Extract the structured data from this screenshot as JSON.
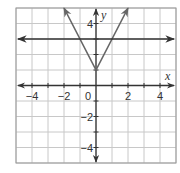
{
  "chart_data": {
    "type": "line",
    "title": "",
    "xlabel": "x",
    "ylabel": "y",
    "xlim": [
      -5,
      5
    ],
    "ylim": [
      -5,
      5
    ],
    "grid": true,
    "x_ticks": [
      -4,
      -2,
      0,
      2,
      4
    ],
    "y_ticks": [
      -4,
      -2,
      4
    ],
    "x_tick_labels": [
      "−4",
      "−2",
      "0",
      "2",
      "4"
    ],
    "y_tick_labels": [
      "−4",
      "−2",
      "4"
    ],
    "series": [
      {
        "name": "absolute value function",
        "description": "V-shaped graph, vertex at (0, 1), slope ±2",
        "points": [
          [
            -2,
            5
          ],
          [
            0,
            1
          ],
          [
            2,
            5
          ]
        ],
        "arrows": "both ends"
      },
      {
        "name": "horizontal line",
        "description": "horizontal line y = 3",
        "points": [
          [
            -5,
            3
          ],
          [
            5,
            3
          ]
        ],
        "arrows": "both ends"
      }
    ]
  },
  "labels": {
    "x_axis": "x",
    "y_axis": "y",
    "origin": "0"
  },
  "colors": {
    "grid": "#c8c8c8",
    "axis": "#333333",
    "v_graph": "#666666",
    "line": "#333333",
    "frame": "#999999"
  }
}
